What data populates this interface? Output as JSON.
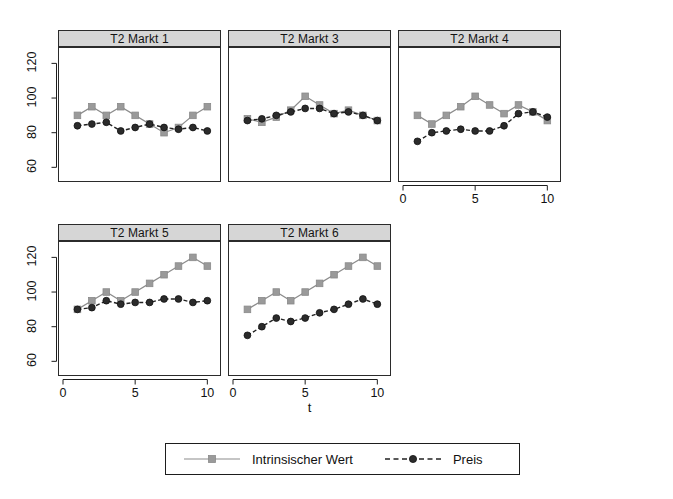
{
  "figure": {
    "xlabel": "t",
    "legend": {
      "entries": [
        {
          "label": "Intrinsischer Wert",
          "marker": "square",
          "line": "solid",
          "color": "#8c8c8c"
        },
        {
          "label": "Preis",
          "marker": "circle",
          "line": "dashed",
          "color": "#222222"
        }
      ]
    }
  },
  "axes": {
    "yticks": [
      60,
      80,
      100,
      120
    ],
    "ylim": [
      55,
      126
    ],
    "xticks": [
      0,
      5,
      10
    ],
    "xlim": [
      0,
      10.6
    ]
  },
  "chart_data": {
    "type": "line",
    "title": "",
    "xlabel": "t",
    "ylabel": "",
    "xlim": [
      0,
      10.6
    ],
    "ylim": [
      55,
      126
    ],
    "xticks": [
      0,
      5,
      10
    ],
    "yticks": [
      60,
      80,
      100,
      120
    ],
    "grid": false,
    "legend_position": "bottom",
    "x": [
      1,
      2,
      3,
      4,
      5,
      6,
      7,
      8,
      9,
      10
    ],
    "panels": [
      {
        "title": "T2 Markt 1",
        "series": [
          {
            "name": "Intrinsischer Wert",
            "values": [
              90,
              95,
              90,
              95,
              90,
              85,
              80,
              83,
              90,
              95
            ]
          },
          {
            "name": "Preis",
            "values": [
              84,
              85,
              86,
              81,
              83,
              85,
              83,
              82,
              83,
              81
            ]
          }
        ]
      },
      {
        "title": "T2 Markt 3",
        "series": [
          {
            "name": "Intrinsischer Wert",
            "values": [
              88,
              86,
              89,
              93,
              101,
              96,
              91,
              93,
              90,
              87
            ]
          },
          {
            "name": "Preis",
            "values": [
              87,
              88,
              90,
              92,
              94,
              94,
              91,
              92,
              90,
              87
            ]
          }
        ]
      },
      {
        "title": "T2 Markt 4",
        "series": [
          {
            "name": "Intrinsischer Wert",
            "values": [
              90,
              85,
              90,
              95,
              101,
              96,
              91,
              96,
              92,
              87
            ]
          },
          {
            "name": "Preis",
            "values": [
              75,
              80,
              81,
              82,
              81,
              81,
              84,
              91,
              92,
              89
            ]
          }
        ]
      },
      {
        "title": "T2 Markt 5",
        "series": [
          {
            "name": "Intrinsischer Wert",
            "values": [
              90,
              95,
              100,
              95,
              100,
              105,
              110,
              115,
              120,
              115
            ]
          },
          {
            "name": "Preis",
            "values": [
              90,
              91,
              95,
              93,
              94,
              94,
              96,
              96,
              94,
              95
            ]
          }
        ]
      },
      {
        "title": "T2 Markt 6",
        "series": [
          {
            "name": "Intrinsischer Wert",
            "values": [
              90,
              95,
              100,
              95,
              100,
              105,
              110,
              115,
              120,
              115
            ]
          },
          {
            "name": "Preis",
            "values": [
              75,
              80,
              85,
              83,
              85,
              88,
              90,
              93,
              96,
              93
            ]
          }
        ]
      }
    ]
  }
}
